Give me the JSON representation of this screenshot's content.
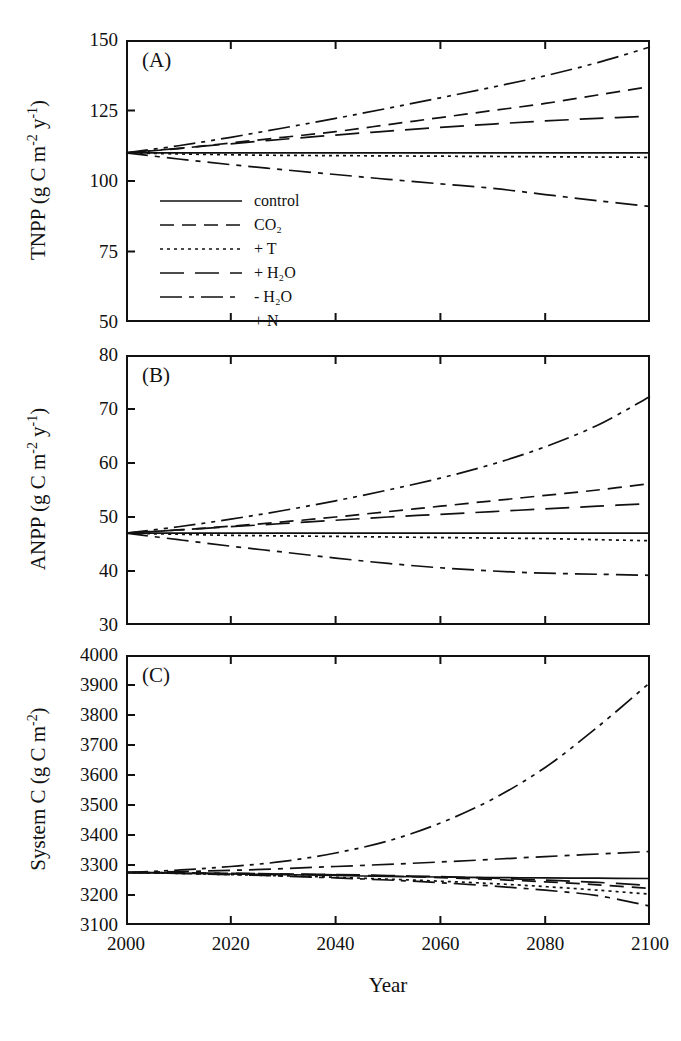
{
  "figure": {
    "xaxis_title": "Year",
    "panels": [
      "A",
      "B",
      "C"
    ]
  },
  "legend": {
    "entries": [
      {
        "label": "control",
        "dash": "none"
      },
      {
        "label": "CO2",
        "label_html": "CO₂",
        "dash": "dashed"
      },
      {
        "label": "+ T",
        "dash": "dotted"
      },
      {
        "label": "+ H2O",
        "label_html": "+ H₂O",
        "dash": "longdash"
      },
      {
        "label": "- H2O",
        "label_html": "- H₂O",
        "dash": "dashdot"
      },
      {
        "label": "+ N",
        "dash": "dashdotdot"
      }
    ]
  },
  "chart_data": [
    {
      "type": "line",
      "panel": "A",
      "title": "(A)",
      "xlabel": "Year",
      "ylabel": "TNPP (g C m-2 y-1)",
      "ylabel_html": "TNPP (g C m<sup>-2</sup> y<sup>-1</sup>)",
      "xlim": [
        2000,
        2100
      ],
      "ylim": [
        50,
        150
      ],
      "xticks": [
        2000,
        2020,
        2040,
        2060,
        2080,
        2100
      ],
      "yticks": [
        50,
        75,
        100,
        125,
        150
      ],
      "grid": false,
      "legend_position": "inside-lower-left",
      "x": [
        2000,
        2010,
        2020,
        2030,
        2040,
        2050,
        2060,
        2070,
        2080,
        2090,
        2100
      ],
      "series": [
        {
          "name": "control",
          "dash": "none",
          "values": [
            110,
            110,
            110,
            110,
            110,
            110,
            110,
            110,
            110,
            110,
            110
          ]
        },
        {
          "name": "CO2",
          "dash": "dashed",
          "values": [
            110,
            111.5,
            113.5,
            115.5,
            117.5,
            120,
            122.5,
            125,
            127.5,
            130.5,
            133.5
          ]
        },
        {
          "name": "+ T",
          "dash": "dotted",
          "values": [
            110,
            109.6,
            109.3,
            109.1,
            109,
            108.9,
            108.8,
            108.7,
            108.6,
            108.5,
            108.4
          ]
        },
        {
          "name": "+ H2O",
          "dash": "longdash",
          "values": [
            110,
            111.6,
            113.2,
            114.8,
            116.3,
            117.7,
            119,
            120.2,
            121.3,
            122.2,
            123
          ]
        },
        {
          "name": "- H2O",
          "dash": "dashdot",
          "values": [
            110,
            107.8,
            105.8,
            104,
            102.3,
            100.6,
            99,
            97.4,
            95.2,
            93,
            91
          ]
        },
        {
          "name": "+ N",
          "dash": "dashdotdot",
          "values": [
            110,
            112.5,
            115.5,
            118.8,
            122.2,
            125.8,
            129.5,
            133.3,
            137.3,
            142,
            147.5
          ]
        }
      ]
    },
    {
      "type": "line",
      "panel": "B",
      "title": "(B)",
      "xlabel": "Year",
      "ylabel": "ANPP (g C m-2 y-1)",
      "ylabel_html": "ANPP  (g C m<sup>-2</sup> y<sup>-1</sup>)",
      "xlim": [
        2000,
        2100
      ],
      "ylim": [
        30,
        80
      ],
      "xticks": [
        2000,
        2020,
        2040,
        2060,
        2080,
        2100
      ],
      "yticks": [
        30,
        40,
        50,
        60,
        70,
        80
      ],
      "grid": false,
      "legend_position": "none",
      "x": [
        2000,
        2010,
        2020,
        2030,
        2040,
        2050,
        2060,
        2070,
        2080,
        2090,
        2100
      ],
      "series": [
        {
          "name": "control",
          "dash": "none",
          "values": [
            47,
            47,
            47,
            47,
            47,
            47,
            47,
            47,
            47,
            47,
            47
          ]
        },
        {
          "name": "CO2",
          "dash": "dashed",
          "values": [
            47,
            47.6,
            48.3,
            49.1,
            50,
            51,
            52,
            53,
            54,
            55,
            56.2
          ]
        },
        {
          "name": "+ T",
          "dash": "dotted",
          "values": [
            47,
            46.8,
            46.6,
            46.5,
            46.4,
            46.3,
            46.2,
            46.1,
            46,
            45.8,
            45.6
          ]
        },
        {
          "name": "+ H2O",
          "dash": "longdash",
          "values": [
            47,
            47.6,
            48.2,
            48.8,
            49.4,
            50,
            50.5,
            51,
            51.5,
            52,
            52.5
          ]
        },
        {
          "name": "- H2O",
          "dash": "dashdot",
          "values": [
            47,
            45.8,
            44.6,
            43.5,
            42.4,
            41.4,
            40.6,
            40,
            39.6,
            39.4,
            39.2
          ]
        },
        {
          "name": "+ N",
          "dash": "dashdotdot",
          "values": [
            47,
            48.2,
            49.6,
            51.2,
            53,
            55,
            57.2,
            59.8,
            63,
            67,
            72.3
          ]
        }
      ]
    },
    {
      "type": "line",
      "panel": "C",
      "title": "(C)",
      "xlabel": "Year",
      "ylabel": "System C (g C m-2)",
      "ylabel_html": "System C (g C m<sup>-2</sup>)",
      "xlim": [
        2000,
        2100
      ],
      "ylim": [
        3100,
        4000
      ],
      "xticks": [
        2000,
        2020,
        2040,
        2060,
        2080,
        2100
      ],
      "yticks": [
        3100,
        3200,
        3300,
        3400,
        3500,
        3600,
        3700,
        3800,
        3900,
        4000
      ],
      "grid": false,
      "legend_position": "none",
      "x": [
        2000,
        2010,
        2020,
        2030,
        2040,
        2050,
        2060,
        2070,
        2080,
        2090,
        2100
      ],
      "series": [
        {
          "name": "control",
          "dash": "none",
          "values": [
            3275,
            3273,
            3270,
            3268,
            3265,
            3262,
            3260,
            3258,
            3257,
            3256,
            3255
          ]
        },
        {
          "name": "CO2",
          "dash": "dashed",
          "values": [
            3275,
            3274,
            3272,
            3270,
            3267,
            3263,
            3258,
            3252,
            3244,
            3234,
            3222
          ]
        },
        {
          "name": "+ T",
          "dash": "dotted",
          "values": [
            3275,
            3272,
            3268,
            3264,
            3259,
            3253,
            3246,
            3238,
            3228,
            3216,
            3203
          ]
        },
        {
          "name": "+ H2O",
          "dash": "longdash",
          "values": [
            3275,
            3274,
            3272,
            3270,
            3268,
            3265,
            3261,
            3256,
            3250,
            3242,
            3232
          ]
        },
        {
          "name": "- H2O",
          "dash": "dashdot",
          "values": [
            3275,
            3272,
            3268,
            3263,
            3257,
            3250,
            3241,
            3230,
            3216,
            3198,
            3163
          ]
        },
        {
          "name": "+ N",
          "dash": "dashdotdot",
          "values": [
            3275,
            3283,
            3295,
            3312,
            3340,
            3380,
            3440,
            3520,
            3625,
            3760,
            3908
          ]
        }
      ]
    },
    {
      "type": "line",
      "panel": "C-secondary",
      "note": "upper shallow dash-dot curve in panel C",
      "x": [
        2000,
        2020,
        2040,
        2060,
        2080,
        2100
      ],
      "series": [
        {
          "name": "- H2O upper",
          "dash": "dashdot",
          "values": [
            3275,
            3282,
            3295,
            3310,
            3328,
            3345
          ]
        }
      ]
    }
  ]
}
